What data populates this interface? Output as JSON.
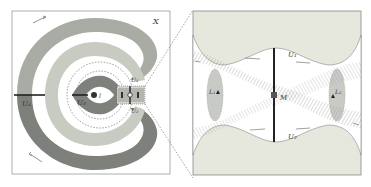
{
  "left_panel": {
    "space_label": "X",
    "labels": {
      "u1": "U₁",
      "u2": "U₂",
      "u3": "U₃",
      "u4": "U₄",
      "l_point": "l",
      "m_point": "M",
      "l1": "L₁",
      "l2": "L₂"
    }
  },
  "right_panel": {
    "labels": {
      "u1": "U₁",
      "u2": "U₂",
      "m_point": "M",
      "l1": "L₁",
      "l2": "L₂"
    }
  },
  "colors": {
    "background": "#ffffff",
    "panel_fill": "#e6e8de",
    "light_band": "#c8cbc2",
    "mid_band": "#a9aca4",
    "dark_band": "#7e817b",
    "frame": "#888888",
    "ink": "#333333"
  }
}
